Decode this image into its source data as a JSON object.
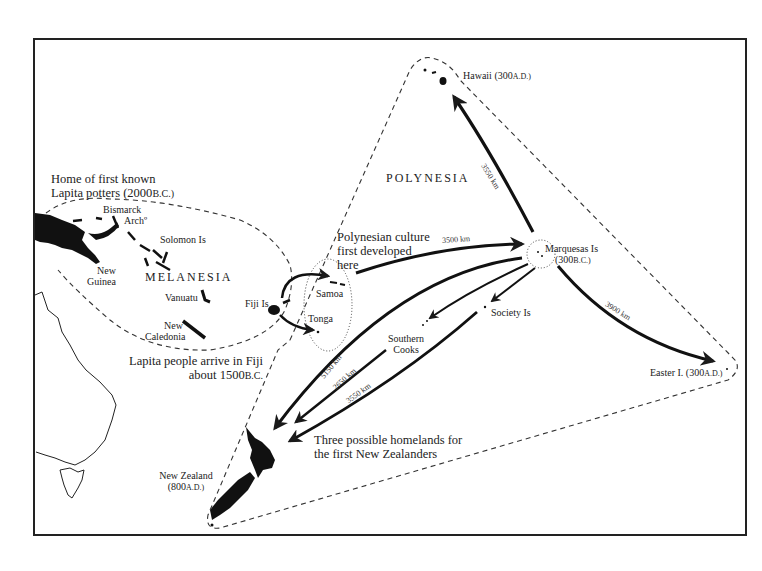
{
  "map": {
    "regions": {
      "melanesia": "MELANESIA",
      "polynesia": "POLYNESIA"
    },
    "annotations": {
      "lapita_home_line1": "Home of first known",
      "lapita_home_line2": "Lapita potters (2000",
      "lapita_home_era": "B.C.)",
      "fiji_arrival_line1": "Lapita people arrive in Fiji",
      "fiji_arrival_line2": "about 1500",
      "fiji_arrival_era": "B.C.",
      "polynesian_culture_line1": "Polynesian culture",
      "polynesian_culture_line2": "first developed",
      "polynesian_culture_line3": "here",
      "homelands_line1": "Three possible homelands for",
      "homelands_line2": "the first New Zealanders"
    },
    "places": {
      "bismarck_line1": "Bismarck",
      "bismarck_line2": "Archº",
      "solomon": "Solomon Is",
      "new_guinea_line1": "New",
      "new_guinea_line2": "Guinea",
      "vanuatu": "Vanuatu",
      "new_caledonia_line1": "New",
      "new_caledonia_line2": "Caledonia",
      "fiji": "Fiji Is",
      "samoa": "Samoa",
      "tonga": "Tonga",
      "hawaii": "Hawaii  (300",
      "hawaii_era": "A.D.)",
      "marquesas_line1": "Marquesas Is",
      "marquesas_line2": "(300",
      "marquesas_era": "B.C.)",
      "society": "Society Is",
      "southern_cooks_line1": "Southern",
      "southern_cooks_line2": "Cooks",
      "easter": "Easter I. (300",
      "easter_era": "A.D.)",
      "new_zealand_line1": "New Zealand",
      "new_zealand_line2": "(800",
      "new_zealand_era": "A.D.)"
    },
    "distances": {
      "samoa_marquesas": "3500 km",
      "marquesas_hawaii": "3550 km",
      "marquesas_easter": "3900 km",
      "marquesas_nz": "5150 km",
      "cooks_nz": "2650 km",
      "society_nz": "3550 km"
    },
    "colors": {
      "ink": "#1a1a1a",
      "paper": "#ffffff"
    }
  }
}
